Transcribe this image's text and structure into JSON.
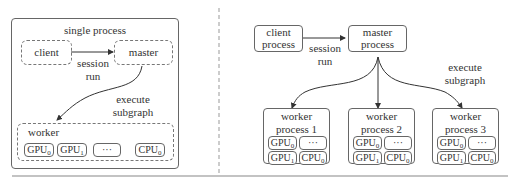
{
  "left_panel": {
    "title": "single process",
    "client": "client",
    "master": "master",
    "edge_client_master": [
      "session",
      "run"
    ],
    "edge_master_worker": [
      "execute",
      "subgraph"
    ],
    "worker": {
      "title": "worker",
      "devices": [
        {
          "name": "GPU",
          "sub": "0"
        },
        {
          "name": "GPU",
          "sub": "1"
        },
        {
          "name": "···",
          "sub": ""
        },
        {
          "name": "CPU",
          "sub": "0"
        }
      ]
    }
  },
  "right_panel": {
    "client": [
      "client",
      "process"
    ],
    "master": [
      "master",
      "process"
    ],
    "edge_client_master": [
      "session",
      "run"
    ],
    "edge_master_workers": [
      "execute",
      "subgraph"
    ],
    "workers": [
      {
        "title": [
          "worker",
          "process 1"
        ],
        "devices": [
          {
            "name": "GPU",
            "sub": "0"
          },
          {
            "name": "···",
            "sub": ""
          },
          {
            "name": "GPU",
            "sub": "1"
          },
          {
            "name": "CPU",
            "sub": "0"
          }
        ]
      },
      {
        "title": [
          "worker",
          "process 2"
        ],
        "devices": [
          {
            "name": "GPU",
            "sub": "0"
          },
          {
            "name": "···",
            "sub": ""
          },
          {
            "name": "GPU",
            "sub": "1"
          },
          {
            "name": "CPU",
            "sub": "0"
          }
        ]
      },
      {
        "title": [
          "worker",
          "process 3"
        ],
        "devices": [
          {
            "name": "GPU",
            "sub": "0"
          },
          {
            "name": "···",
            "sub": ""
          },
          {
            "name": "GPU",
            "sub": "1"
          },
          {
            "name": "CPU",
            "sub": "0"
          }
        ]
      }
    ]
  },
  "colors": {
    "stroke": "#666666",
    "text": "#333333",
    "divider": "#999999"
  }
}
